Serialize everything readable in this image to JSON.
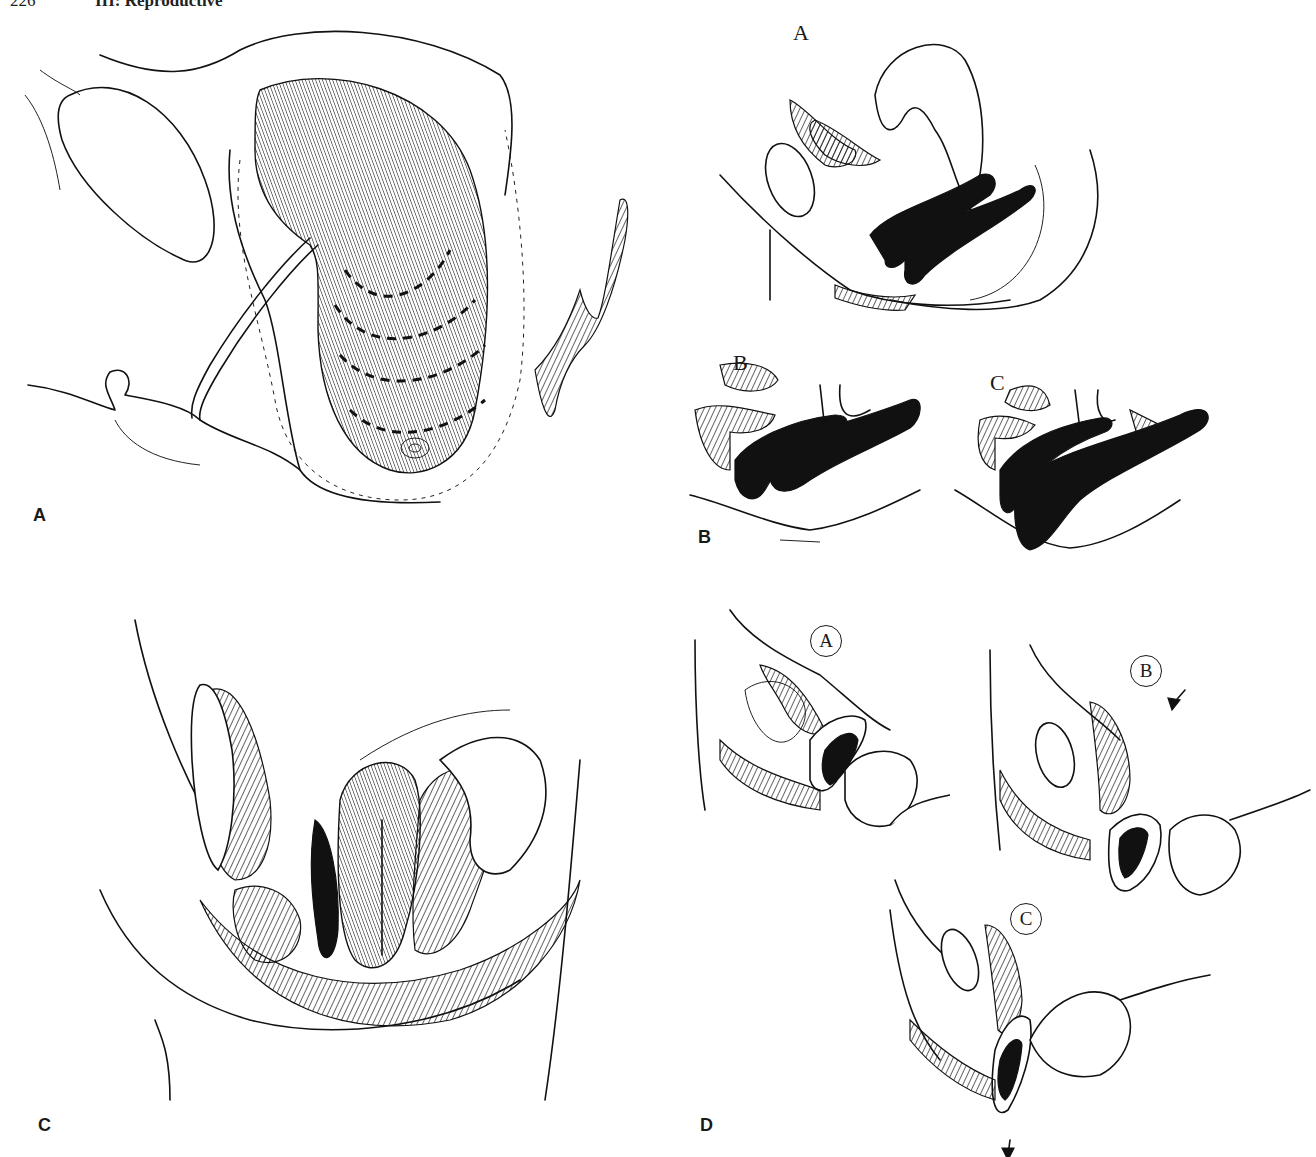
{
  "page": {
    "running_head": {
      "page_number": "226",
      "title": "III: Reproductive"
    }
  },
  "figure": {
    "panels": [
      {
        "id": "A",
        "label": "A",
        "sub_labels": []
      },
      {
        "id": "B",
        "label": "B",
        "sub_labels": [
          "A",
          "B",
          "C"
        ]
      },
      {
        "id": "C",
        "label": "C",
        "sub_labels": []
      },
      {
        "id": "D",
        "label": "D",
        "sub_labels": [
          "A",
          "B",
          "C"
        ]
      }
    ]
  }
}
